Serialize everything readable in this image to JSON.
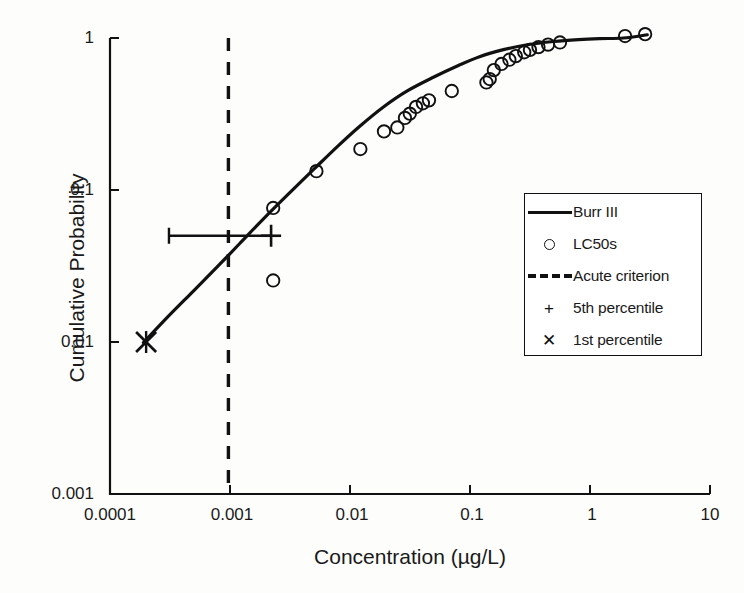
{
  "chart_data": {
    "type": "scatter",
    "title": "",
    "xlabel": "Concentration (µg/L)",
    "ylabel": "Cumulative Probability",
    "xscale": "log",
    "yscale": "log",
    "xlim": [
      0.0001,
      10
    ],
    "ylim": [
      0.001,
      1
    ],
    "grid": false,
    "xticks": [
      "0.0001",
      "0.001",
      "0.01",
      "0.1",
      "1",
      "10"
    ],
    "xtick_values": [
      0.0001,
      0.001,
      0.01,
      0.1,
      1,
      10
    ],
    "yticks": [
      "0.001",
      "0.01",
      "0.1",
      "1"
    ],
    "ytick_values": [
      0.001,
      0.01,
      0.1,
      1
    ],
    "legend_position": "center-right",
    "series": [
      {
        "name": "Burr III",
        "type": "line",
        "style": "solid",
        "x": [
          0.00019,
          0.0003,
          0.0005,
          0.0008,
          0.0012,
          0.0019,
          0.003,
          0.005,
          0.008,
          0.012,
          0.019,
          0.03,
          0.05,
          0.08,
          0.12,
          0.19,
          0.3,
          0.5,
          0.8,
          1.2,
          1.9,
          3.0
        ],
        "y": [
          0.0099,
          0.0145,
          0.0218,
          0.0318,
          0.0443,
          0.0646,
          0.0925,
          0.137,
          0.196,
          0.262,
          0.352,
          0.449,
          0.554,
          0.66,
          0.754,
          0.838,
          0.903,
          0.948,
          0.975,
          0.99,
          1.0,
          1.05
        ]
      },
      {
        "name": "LC50s",
        "type": "scatter",
        "marker": "circle",
        "x": [
          0.00229,
          0.00229,
          0.00525,
          0.0122,
          0.0192,
          0.0248,
          0.0287,
          0.0315,
          0.0355,
          0.0405,
          0.0455,
          0.0705,
          0.137,
          0.146,
          0.158,
          0.183,
          0.213,
          0.241,
          0.283,
          0.316,
          0.372,
          0.447,
          0.562,
          1.96,
          2.88
        ],
        "y": [
          0.0762,
          0.0254,
          0.133,
          0.186,
          0.243,
          0.258,
          0.298,
          0.318,
          0.352,
          0.372,
          0.389,
          0.448,
          0.51,
          0.537,
          0.615,
          0.675,
          0.72,
          0.76,
          0.806,
          0.835,
          0.871,
          0.905,
          0.935,
          1.03,
          1.06
        ]
      },
      {
        "name": "Acute criterion",
        "type": "vline",
        "style": "dashed",
        "x": 0.00097
      },
      {
        "name": "5th percentile",
        "type": "point",
        "marker": "plus",
        "x": 0.0022,
        "y": 0.05,
        "error_x_low": 0.00031,
        "error_x_high": 0.0022
      },
      {
        "name": "1st percentile",
        "type": "point",
        "marker": "x",
        "x": 0.0002,
        "y": 0.01
      }
    ]
  },
  "axes": {
    "x_title": "Concentration (µg/L)",
    "y_title": "Cumulative Probability",
    "x_tick_labels": [
      "0.0001",
      "0.001",
      "0.01",
      "0.1",
      "1",
      "10"
    ],
    "y_tick_labels": [
      "1",
      "0.1",
      "0.01",
      "0.001"
    ]
  },
  "legend": {
    "entries": [
      {
        "key": "solid-line",
        "label": "Burr III"
      },
      {
        "key": "circle-marker",
        "label": "LC50s"
      },
      {
        "key": "dashed-line",
        "label": "Acute criterion"
      },
      {
        "key": "plus-marker",
        "label": "5th percentile",
        "glyph": "+"
      },
      {
        "key": "x-marker",
        "label": "1st percentile",
        "glyph": "✕"
      }
    ]
  },
  "colors": {
    "ink": "#111111",
    "background": "#fdfdfc"
  }
}
